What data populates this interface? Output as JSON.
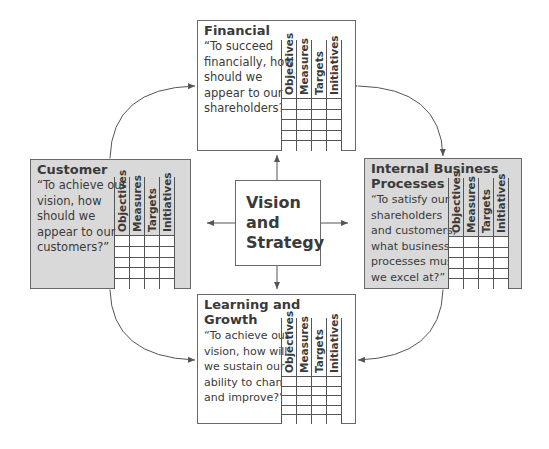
{
  "center": {
    "lines": [
      "Vision",
      "and",
      "Strategy"
    ]
  },
  "columns": [
    "Objectives",
    "Measures",
    "Targets",
    "Initiatives"
  ],
  "perspectives": {
    "financial": {
      "title_lines": [
        "Financial"
      ],
      "question_lines": [
        "“To succeed",
        "financially, how",
        "should we",
        "appear to our",
        "shareholders?”"
      ],
      "fill": "#ffffff"
    },
    "customer": {
      "title_lines": [
        "Customer"
      ],
      "question_lines": [
        "“To achieve our",
        "vision, how",
        "should we",
        "appear to our",
        "customers?”"
      ],
      "fill": "#d9d9d9"
    },
    "internal": {
      "title_lines": [
        "Internal Business",
        "Processes"
      ],
      "question_lines": [
        "“To satisfy our",
        "shareholders",
        "and customers,",
        "what business",
        "processes must",
        "we excel at?”"
      ],
      "fill": "#d9d9d9"
    },
    "learning": {
      "title_lines": [
        "Learning and",
        "Growth"
      ],
      "question_lines": [
        "“To achieve our",
        "vision, how will",
        "we sustain our",
        "ability to change",
        "and improve?”"
      ],
      "fill": "#ffffff"
    }
  },
  "grid_rows": 5,
  "colors": {
    "stroke": "#555555",
    "text": "#3a3a3a",
    "gray_fill": "#d9d9d9"
  }
}
